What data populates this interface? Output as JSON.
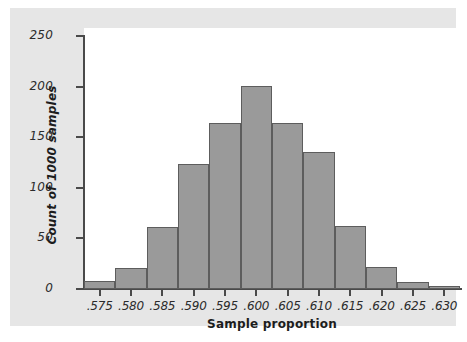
{
  "chart_data": {
    "type": "bar",
    "title": "",
    "subtitle": "",
    "xlabel": "Sample proportion",
    "ylabel": "Count of 1000 samples",
    "categories": [
      ".575",
      ".580",
      ".585",
      ".590",
      ".595",
      ".600",
      ".605",
      ".610",
      ".615",
      ".620",
      ".625",
      ".630"
    ],
    "bin_edges": [
      0.5725,
      0.5775,
      0.5825,
      0.5875,
      0.5925,
      0.5975,
      0.6025,
      0.6075,
      0.6125,
      0.6175,
      0.6225,
      0.6275,
      0.6325
    ],
    "values": [
      8,
      21,
      61,
      124,
      164,
      201,
      164,
      135,
      62,
      22,
      7,
      3
    ],
    "xlim": [
      0.5725,
      0.6325
    ],
    "ylim": [
      0,
      250
    ],
    "x_tick_labels": [
      ".575",
      ".580",
      ".585",
      ".590",
      ".595",
      ".600",
      ".605",
      ".610",
      ".615",
      ".620",
      ".625",
      ".630"
    ],
    "x_tick_values": [
      0.575,
      0.58,
      0.585,
      0.59,
      0.595,
      0.6,
      0.605,
      0.61,
      0.615,
      0.62,
      0.625,
      0.63
    ],
    "y_tick_labels": [
      "0",
      "50",
      "100",
      "150",
      "200",
      "250"
    ],
    "y_tick_values": [
      0,
      50,
      100,
      150,
      200,
      250
    ],
    "grid": false,
    "legend": false,
    "bar_fill_color": "#9a9a9a",
    "bar_edge_color": "#5d5d5d",
    "axis_color": "#4a4a4a",
    "panel_color": "#e6e6e6",
    "plot_background": "#ffffff"
  }
}
